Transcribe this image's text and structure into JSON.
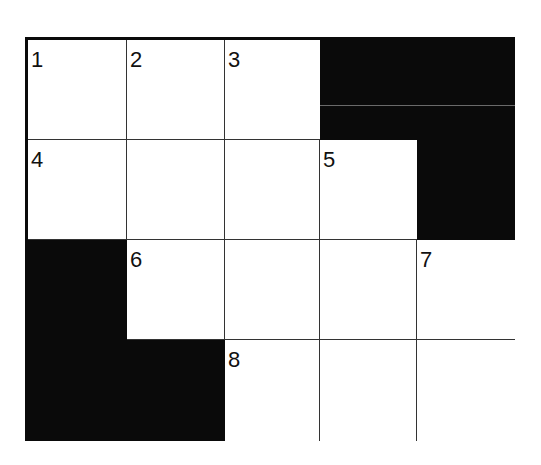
{
  "puzzle": {
    "type": "crossword",
    "rows": 4,
    "cols": 5,
    "colors": {
      "block": "#0a0a0a",
      "open": "#ffffff",
      "line": "#333333"
    },
    "grid": [
      [
        {
          "black": false,
          "number": "1"
        },
        {
          "black": false,
          "number": "2"
        },
        {
          "black": false,
          "number": "3"
        },
        {
          "black": true,
          "number": ""
        },
        {
          "black": true,
          "number": ""
        }
      ],
      [
        {
          "black": false,
          "number": "4"
        },
        {
          "black": false,
          "number": ""
        },
        {
          "black": false,
          "number": ""
        },
        {
          "black": false,
          "number": "5"
        },
        {
          "black": true,
          "number": ""
        }
      ],
      [
        {
          "black": true,
          "number": ""
        },
        {
          "black": false,
          "number": "6"
        },
        {
          "black": false,
          "number": ""
        },
        {
          "black": false,
          "number": ""
        },
        {
          "black": false,
          "number": "7"
        }
      ],
      [
        {
          "black": true,
          "number": ""
        },
        {
          "black": true,
          "number": ""
        },
        {
          "black": false,
          "number": "8"
        },
        {
          "black": false,
          "number": ""
        },
        {
          "black": false,
          "number": ""
        }
      ]
    ]
  }
}
